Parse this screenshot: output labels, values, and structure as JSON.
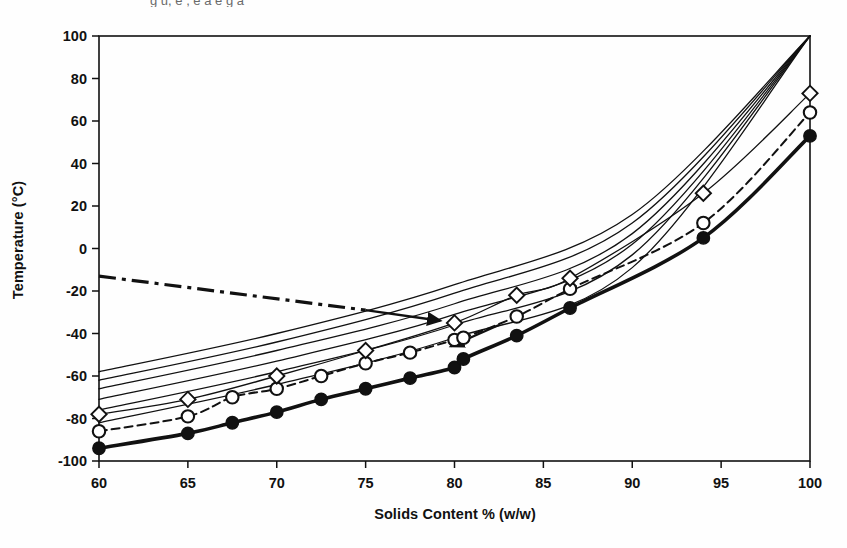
{
  "figure": {
    "background_color": "#fefefe",
    "ink_color": "#111111",
    "cropped_caption_fragment": "g u, e  ,  e   a  e  g a "
  },
  "axes": {
    "x_axis_title": "Solids Content % (w/w)",
    "y_axis_title": "Temperature (°C)",
    "x_ticks": [
      "60",
      "65",
      "70",
      "75",
      "80",
      "85",
      "90",
      "95",
      "100"
    ],
    "y_ticks": [
      "100",
      "80",
      "60",
      "40",
      "20",
      "0",
      "-20",
      "-40",
      "-60",
      "-80",
      "-100"
    ]
  },
  "chart_data": {
    "type": "line",
    "title": "",
    "xlabel": "Solids Content % (w/w)",
    "ylabel": "Temperature (°C)",
    "xlim": [
      60,
      100
    ],
    "ylim": [
      -100,
      100
    ],
    "xticks": [
      60,
      65,
      70,
      75,
      80,
      85,
      90,
      95,
      100
    ],
    "yticks": [
      -100,
      -80,
      -60,
      -40,
      -20,
      0,
      20,
      40,
      60,
      80,
      100
    ],
    "grid": false,
    "legend": "none",
    "series": [
      {
        "name": "glass transition curve (thick solid, filled circles)",
        "style": "solid",
        "line_width": "thick",
        "marker": "filled-circle",
        "x": [
          60,
          65,
          67.5,
          70,
          72.5,
          75,
          77.5,
          80,
          80.5,
          83.5,
          86.5,
          94,
          100
        ],
        "y": [
          -94,
          -87,
          -82,
          -77,
          -71,
          -66,
          -61,
          -56,
          -52,
          -41,
          -28,
          5,
          53
        ]
      },
      {
        "name": "intermediate curve (dashed, open circles)",
        "style": "dashed",
        "line_width": "medium",
        "marker": "open-circle",
        "x": [
          60,
          65,
          67.5,
          70,
          72.5,
          75,
          77.5,
          80,
          80.5,
          83.5,
          86.5,
          94,
          100
        ],
        "y": [
          -86,
          -79,
          -70,
          -66,
          -60,
          -54,
          -49,
          -43,
          -42,
          -32,
          -19,
          12,
          64
        ]
      },
      {
        "name": "upper curve with diamond markers",
        "style": "solid",
        "line_width": "thin",
        "marker": "open-diamond",
        "x": [
          60,
          65,
          70,
          75,
          80,
          83.5,
          86.5,
          94,
          100
        ],
        "y": [
          -78,
          -71,
          -60,
          -48,
          -35,
          -22,
          -14,
          26,
          73
        ]
      },
      {
        "name": "thin curve family member 1 (lowest)",
        "style": "solid",
        "line_width": "thin",
        "marker": "none",
        "x": [
          60,
          70,
          80,
          90,
          100
        ],
        "y": [
          -82,
          -64,
          -42,
          -9,
          100
        ]
      },
      {
        "name": "thin curve family member 2",
        "style": "solid",
        "line_width": "thin",
        "marker": "none",
        "x": [
          60,
          70,
          80,
          90,
          100
        ],
        "y": [
          -76,
          -58,
          -36,
          -3,
          100
        ]
      },
      {
        "name": "thin curve family member 3",
        "style": "solid",
        "line_width": "thin",
        "marker": "none",
        "x": [
          60,
          70,
          80,
          90,
          100
        ],
        "y": [
          -71,
          -53,
          -31,
          2,
          100
        ]
      },
      {
        "name": "thin curve family member 4",
        "style": "solid",
        "line_width": "thin",
        "marker": "none",
        "x": [
          60,
          70,
          80,
          90,
          100
        ],
        "y": [
          -66,
          -48,
          -26,
          7,
          100
        ]
      },
      {
        "name": "thin curve family member 5",
        "style": "solid",
        "line_width": "thin",
        "marker": "none",
        "x": [
          60,
          70,
          80,
          90,
          100
        ],
        "y": [
          -62,
          -44,
          -21,
          12,
          100
        ]
      },
      {
        "name": "thin curve family member 6 (highest)",
        "style": "solid",
        "line_width": "thin",
        "marker": "none",
        "x": [
          60,
          70,
          80,
          90,
          100
        ],
        "y": [
          -58,
          -40,
          -17,
          16,
          100
        ]
      }
    ],
    "annotations": [
      {
        "name": "dash-dot leader line",
        "style": "dash-dot",
        "x": [
          60,
          75
        ],
        "y": [
          -13,
          -29
        ]
      },
      {
        "name": "arrow pointing to curve family (upper)",
        "style": "arrow",
        "from": [
          75,
          -29
        ],
        "to": [
          79.2,
          -34
        ]
      },
      {
        "name": "arrow pointing to curve family (lower)",
        "style": "arrow",
        "from": [
          82.5,
          -36
        ],
        "to": [
          79.8,
          -46
        ]
      }
    ]
  }
}
